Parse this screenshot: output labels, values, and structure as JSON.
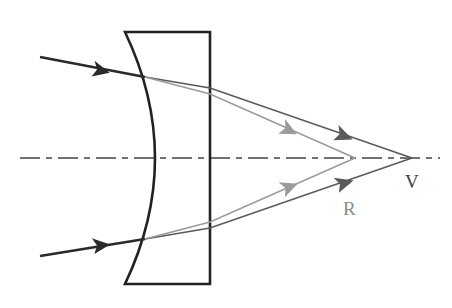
{
  "diagram": {
    "labels": {
      "V": "V",
      "R": "R"
    },
    "colors": {
      "background": "#ffffff",
      "lens_outline": "#222222",
      "incident_ray": "#2a2a2a",
      "ray_V": "#5a5a5a",
      "ray_R": "#9a9a9a",
      "label_V": "#444444",
      "label_R": "#8a8a8a",
      "axis": "#444444"
    },
    "points": {
      "V": {
        "x": 412,
        "y": 158
      },
      "R": {
        "x": 355,
        "y": 158
      }
    }
  }
}
